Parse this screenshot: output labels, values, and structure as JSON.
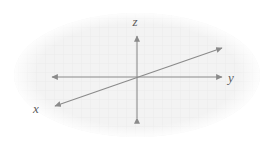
{
  "figure": {
    "name": "three-dimensional-coordinate-axes",
    "background_color": "#ffffff",
    "width": 267,
    "height": 144
  },
  "backdrop": {
    "shape": "ellipse",
    "fill_color": "#f2f2f2",
    "texture": "faint-grid",
    "texture_color": "#ebebeb",
    "center_x": 137,
    "center_y": 75,
    "radius_x": 123,
    "radius_y": 62
  },
  "origin": {
    "x": 137,
    "y": 77
  },
  "axes": [
    {
      "id": "z",
      "label": "z",
      "color": "#8a8a8a",
      "stroke_width": 1.1,
      "orientation": "vertical",
      "arrowheads": "both",
      "x1": 137,
      "y1": 118,
      "x2": 137,
      "y2": 36,
      "label_x": 135,
      "label_y": 26
    },
    {
      "id": "y",
      "label": "y",
      "color": "#8a8a8a",
      "stroke_width": 1.1,
      "orientation": "horizontal",
      "arrowheads": "both",
      "x1": 52,
      "y1": 77,
      "x2": 222,
      "y2": 77,
      "label_x": 231,
      "label_y": 82
    },
    {
      "id": "x",
      "label": "x",
      "color": "#8a8a8a",
      "stroke_width": 1.1,
      "orientation": "diagonal",
      "arrowheads": "both",
      "x1": 55,
      "y1": 106,
      "x2": 222,
      "y2": 48,
      "label_x": 36,
      "label_y": 113
    }
  ],
  "chart_data": {
    "type": "diagram",
    "title": "",
    "subtitle": "",
    "annotations": [
      "z",
      "y",
      "x"
    ],
    "legend": [],
    "grid": false
  }
}
